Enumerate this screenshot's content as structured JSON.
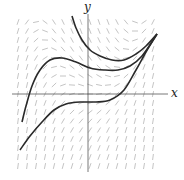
{
  "figure": {
    "type": "slope-field",
    "axis_labels": {
      "x": "x",
      "y": "y"
    },
    "colors": {
      "axis": "#555555",
      "field": "#b5b5b5",
      "curve": "#2a2a2a",
      "background": "#ffffff"
    },
    "axes": {
      "origin_px": [
        88,
        94
      ],
      "x_extent_px": [
        12,
        168
      ],
      "y_extent_px": [
        14,
        172
      ]
    },
    "field_region_px": {
      "x0": 18,
      "x1": 158,
      "y0": 22,
      "y1": 168,
      "step": 9,
      "seg_len": 6
    },
    "solution_curves": [
      {
        "name": "upper-curve",
        "points": [
          [
            72,
            16
          ],
          [
            76,
            28
          ],
          [
            82,
            40
          ],
          [
            90,
            50
          ],
          [
            100,
            56
          ],
          [
            112,
            60
          ],
          [
            124,
            60
          ],
          [
            136,
            54
          ],
          [
            146,
            46
          ],
          [
            157,
            34
          ]
        ]
      },
      {
        "name": "middle-curve",
        "points": [
          [
            22,
            122
          ],
          [
            26,
            106
          ],
          [
            32,
            86
          ],
          [
            40,
            70
          ],
          [
            50,
            60
          ],
          [
            62,
            58
          ],
          [
            76,
            62
          ],
          [
            90,
            68
          ],
          [
            104,
            70
          ],
          [
            118,
            70
          ],
          [
            130,
            66
          ],
          [
            142,
            56
          ],
          [
            157,
            34
          ]
        ]
      },
      {
        "name": "lower-curve",
        "points": [
          [
            20,
            150
          ],
          [
            30,
            136
          ],
          [
            42,
            122
          ],
          [
            54,
            110
          ],
          [
            66,
            104
          ],
          [
            80,
            102
          ],
          [
            96,
            102
          ],
          [
            110,
            100
          ],
          [
            124,
            90
          ],
          [
            136,
            70
          ],
          [
            146,
            52
          ],
          [
            157,
            34
          ]
        ]
      }
    ]
  }
}
